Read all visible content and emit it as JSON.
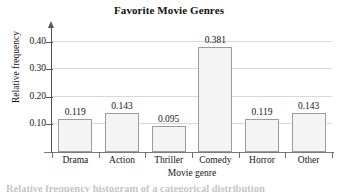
{
  "chart_data": {
    "type": "bar",
    "title": "Favorite Movie Genres",
    "xlabel": "Movie genre",
    "ylabel": "Relative frequency",
    "categories": [
      "Drama",
      "Action",
      "Thriller",
      "Comedy",
      "Horror",
      "Other"
    ],
    "values": [
      0.119,
      0.143,
      0.095,
      0.381,
      0.119,
      0.143
    ],
    "value_labels": [
      "0.119",
      "0.143",
      "0.095",
      "0.381",
      "0.119",
      "0.143"
    ],
    "ylim": [
      0.0,
      0.45
    ],
    "yticks": [
      0.1,
      0.2,
      0.3,
      0.4
    ],
    "ytick_labels": [
      "0.10",
      "0.20",
      "0.30",
      "0.40"
    ],
    "grid": true,
    "legend": "none",
    "bar_fill_color": "#f4f4f5",
    "bar_border_color": "#9c9ca0",
    "gridline_color": "#d8d8da",
    "axis_color": "#555558"
  },
  "caption": {
    "text": "Relative frequency histogram of a categorical distribution",
    "note": "clipped"
  }
}
